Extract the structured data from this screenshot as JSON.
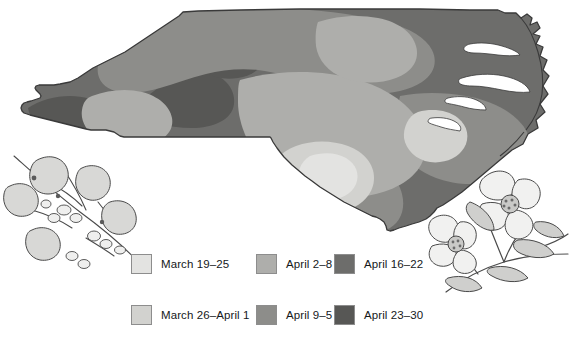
{
  "map": {
    "title": "North Carolina average date of spring arrival",
    "state": "North Carolina",
    "regions_note": "Shaded bands from coast to mountains"
  },
  "legend": {
    "columns": [
      {
        "items": [
          {
            "label": "March 19–25",
            "color": "#e3e3e1",
            "order": 1
          },
          {
            "label": "March 26–April 1",
            "color": "#d2d2cf",
            "order": 2
          }
        ]
      },
      {
        "items": [
          {
            "label": "April 2–8",
            "color": "#aeaeab",
            "order": 3
          },
          {
            "label": "April 9–5",
            "color": "#8d8d8a",
            "order": 4
          }
        ]
      },
      {
        "items": [
          {
            "label": "April 16–22",
            "color": "#6d6d6b",
            "order": 5
          },
          {
            "label": "April 23–30",
            "color": "#575755",
            "order": 6
          }
        ]
      }
    ]
  },
  "illustrations": {
    "left": {
      "name": "redbud-branch",
      "caption": ""
    },
    "right": {
      "name": "dogwood-branch",
      "caption": ""
    }
  },
  "colors": {
    "band1": "#e3e3e1",
    "band2": "#d2d2cf",
    "band3": "#aeaeab",
    "band4": "#8d8d8a",
    "band5": "#6d6d6b",
    "band6": "#575755",
    "outline": "#3c3c3c",
    "background": "#ffffff",
    "text": "#15181b"
  }
}
